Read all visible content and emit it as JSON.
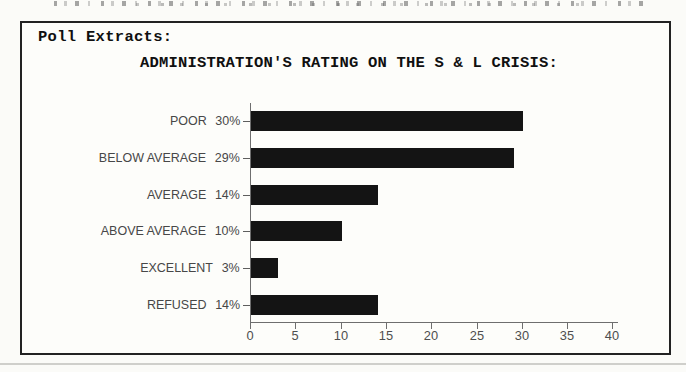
{
  "panel": {
    "header": "Poll Extracts:",
    "title": "ADMINISTRATION'S RATING ON THE S & L CRISIS:"
  },
  "chart_data": {
    "type": "bar",
    "orientation": "horizontal",
    "title": "ADMINISTRATION'S RATING ON THE S & L CRISIS:",
    "categories": [
      "POOR",
      "BELOW AVERAGE",
      "AVERAGE",
      "ABOVE AVERAGE",
      "EXCELLENT",
      "REFUSED"
    ],
    "values": [
      30,
      29,
      14,
      10,
      3,
      14
    ],
    "value_labels": [
      "30%",
      "29%",
      "14%",
      "10%",
      "3%",
      "14%"
    ],
    "xlabel": "",
    "ylabel": "",
    "xlim": [
      0,
      40
    ],
    "xticks": [
      0,
      5,
      10,
      15,
      20,
      25,
      30,
      35,
      40
    ],
    "grid": false,
    "legend": false,
    "bar_color": "#141414",
    "axis_color": "#6e6e6e",
    "label_color": "#474747"
  }
}
